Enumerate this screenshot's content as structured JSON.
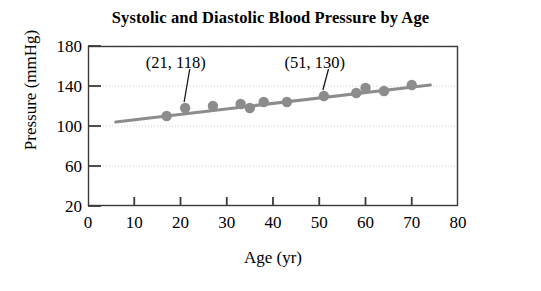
{
  "chart_data": {
    "type": "scatter",
    "title": "Systolic and Diastolic Blood Pressure by Age",
    "xlabel": "Age (yr)",
    "ylabel": "Pressure (mmHg)",
    "xlim": [
      0,
      80
    ],
    "ylim": [
      20,
      180
    ],
    "xticks": [
      0,
      10,
      20,
      30,
      40,
      50,
      60,
      70,
      80
    ],
    "yticks": [
      20,
      60,
      100,
      140,
      180
    ],
    "grid": "horizontal-dotted",
    "legend": "none",
    "marker_color": "#8c8c8c",
    "line_color": "#8c8c8c",
    "axis_color": "#3a3a3a",
    "grid_color": "#cccccc",
    "series": [
      {
        "name": "Blood pressure by age",
        "points": [
          {
            "x": 17,
            "y": 110
          },
          {
            "x": 21,
            "y": 118
          },
          {
            "x": 27,
            "y": 120
          },
          {
            "x": 33,
            "y": 122
          },
          {
            "x": 35,
            "y": 118
          },
          {
            "x": 38,
            "y": 124
          },
          {
            "x": 43,
            "y": 124
          },
          {
            "x": 51,
            "y": 130
          },
          {
            "x": 58,
            "y": 133
          },
          {
            "x": 60,
            "y": 138
          },
          {
            "x": 64,
            "y": 135
          },
          {
            "x": 70,
            "y": 141
          }
        ]
      }
    ],
    "trendline": {
      "x_start": 6,
      "y_start": 104,
      "x_end": 74,
      "y_end": 141
    },
    "annotations": [
      {
        "label": "(21, 118)",
        "text_x": 22,
        "text_y": 163,
        "point_x": 21,
        "point_y": 118
      },
      {
        "label": "(51, 130)",
        "text_x": 52,
        "text_y": 163,
        "point_x": 51,
        "point_y": 130
      }
    ]
  }
}
